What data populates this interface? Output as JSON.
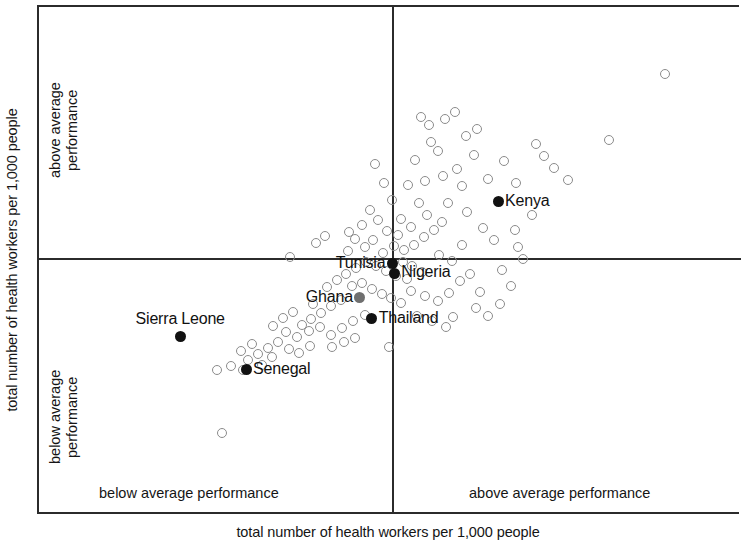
{
  "axes": {
    "y_title": "total number of health workers per 1,000 people",
    "x_title": "total number of health workers per 1,000 people"
  },
  "quadrants": {
    "y_above": "above average\nperformance",
    "y_above_line1": "above average",
    "y_above_line2": "performance",
    "y_below_line1": "below average",
    "y_below_line2": "performance",
    "x_below": "below average performance",
    "x_above": "above average performance"
  },
  "chart_data": {
    "type": "scatter",
    "title": "",
    "xlabel": "total number of health workers per 1,000 people",
    "ylabel": "total number of health workers per 1,000 people",
    "xlim": [
      0,
      100
    ],
    "ylim": [
      0,
      100
    ],
    "grid": false,
    "legend": "none",
    "quadrant_divider_x_pct": 50.5,
    "quadrant_divider_y_pct": 49.5,
    "highlighted": [
      {
        "name": "Kenya",
        "x_pct": 65.4,
        "y_pct": 38.4,
        "marker": "filled",
        "label_side": "right"
      },
      {
        "name": "Tunisia",
        "x_pct": 50.4,
        "y_pct": 50.6,
        "marker": "filled",
        "label_side": "left"
      },
      {
        "name": "Nigeria",
        "x_pct": 50.6,
        "y_pct": 52.5,
        "marker": "filled",
        "label_side": "right"
      },
      {
        "name": "Ghana",
        "x_pct": 45.7,
        "y_pct": 57.3,
        "marker": "grayfill",
        "label_side": "left"
      },
      {
        "name": "Thailand",
        "x_pct": 47.4,
        "y_pct": 61.5,
        "marker": "filled",
        "label_side": "right"
      },
      {
        "name": "Sierra Leone",
        "x_pct": 20.1,
        "y_pct": 64.9,
        "marker": "filled",
        "label_side": "above"
      },
      {
        "name": "Senegal",
        "x_pct": 29.5,
        "y_pct": 71.5,
        "marker": "filled",
        "label_side": "right"
      }
    ],
    "unlabeled_points": [
      [
        89.2,
        13.3
      ],
      [
        81.2,
        26.2
      ],
      [
        75.4,
        34.2
      ],
      [
        67.8,
        44.0
      ],
      [
        66.2,
        30.3
      ],
      [
        68.0,
        34.8
      ],
      [
        70.2,
        41.1
      ],
      [
        68.3,
        47.4
      ],
      [
        69.0,
        49.7
      ],
      [
        63.2,
        43.6
      ],
      [
        63.9,
        34.0
      ],
      [
        62.0,
        29.2
      ],
      [
        59.5,
        32.0
      ],
      [
        60.3,
        35.3
      ],
      [
        61.0,
        40.4
      ],
      [
        58.2,
        38.6
      ],
      [
        56.9,
        28.5
      ],
      [
        55.8,
        26.7
      ],
      [
        57.6,
        33.4
      ],
      [
        55.0,
        34.3
      ],
      [
        53.5,
        30.1
      ],
      [
        52.5,
        35.2
      ],
      [
        54.2,
        38.7
      ],
      [
        55.2,
        41.1
      ],
      [
        53.0,
        43.4
      ],
      [
        51.5,
        41.9
      ],
      [
        50.3,
        38.0
      ],
      [
        49.2,
        34.8
      ],
      [
        47.8,
        31.0
      ],
      [
        51.2,
        45.0
      ],
      [
        49.6,
        44.2
      ],
      [
        48.3,
        42.1
      ],
      [
        47.2,
        40.0
      ],
      [
        46.0,
        43.0
      ],
      [
        45.0,
        45.8
      ],
      [
        44.0,
        48.2
      ],
      [
        46.4,
        47.4
      ],
      [
        47.6,
        46.0
      ],
      [
        49.0,
        48.5
      ],
      [
        50.5,
        47.2
      ],
      [
        52.0,
        48.0
      ],
      [
        53.4,
        47.0
      ],
      [
        54.8,
        45.4
      ],
      [
        56.2,
        44.0
      ],
      [
        57.4,
        42.4
      ],
      [
        51.8,
        50.3
      ],
      [
        53.2,
        51.0
      ],
      [
        54.6,
        52.2
      ],
      [
        52.4,
        53.6
      ],
      [
        50.8,
        53.0
      ],
      [
        49.4,
        52.0
      ],
      [
        48.0,
        51.0
      ],
      [
        46.6,
        50.2
      ],
      [
        45.2,
        51.4
      ],
      [
        43.8,
        52.6
      ],
      [
        42.4,
        53.8
      ],
      [
        41.0,
        55.2
      ],
      [
        44.6,
        55.0
      ],
      [
        46.0,
        54.4
      ],
      [
        47.4,
        55.6
      ],
      [
        48.8,
        56.6
      ],
      [
        50.2,
        57.4
      ],
      [
        51.6,
        58.4
      ],
      [
        53.0,
        56.0
      ],
      [
        55.0,
        57.0
      ],
      [
        56.8,
        58.0
      ],
      [
        58.4,
        56.4
      ],
      [
        60.0,
        54.0
      ],
      [
        61.4,
        52.6
      ],
      [
        58.8,
        50.0
      ],
      [
        60.2,
        47.0
      ],
      [
        57.0,
        49.0
      ],
      [
        43.0,
        57.8
      ],
      [
        41.6,
        59.0
      ],
      [
        40.2,
        60.4
      ],
      [
        38.8,
        61.6
      ],
      [
        37.4,
        62.8
      ],
      [
        39.0,
        58.6
      ],
      [
        36.2,
        60.2
      ],
      [
        34.8,
        61.4
      ],
      [
        33.4,
        63.0
      ],
      [
        35.2,
        64.2
      ],
      [
        36.8,
        65.0
      ],
      [
        38.4,
        64.0
      ],
      [
        40.0,
        63.2
      ],
      [
        41.6,
        64.6
      ],
      [
        43.2,
        63.4
      ],
      [
        44.8,
        62.0
      ],
      [
        46.4,
        60.8
      ],
      [
        34.0,
        66.0
      ],
      [
        32.6,
        67.2
      ],
      [
        31.2,
        68.4
      ],
      [
        29.8,
        69.6
      ],
      [
        31.8,
        70.6
      ],
      [
        33.2,
        69.0
      ],
      [
        30.4,
        66.4
      ],
      [
        28.8,
        67.8
      ],
      [
        27.4,
        70.8
      ],
      [
        29.0,
        71.6
      ],
      [
        35.6,
        67.4
      ],
      [
        37.0,
        68.2
      ],
      [
        38.6,
        66.8
      ],
      [
        43.4,
        66.0
      ],
      [
        45.0,
        65.2
      ],
      [
        41.8,
        67.0
      ],
      [
        56.0,
        62.0
      ],
      [
        59.0,
        61.2
      ],
      [
        62.2,
        59.4
      ],
      [
        35.8,
        49.4
      ],
      [
        40.8,
        45.2
      ],
      [
        44.2,
        44.4
      ],
      [
        25.4,
        71.6
      ],
      [
        26.0,
        84.0
      ],
      [
        49.8,
        67.0
      ],
      [
        39.4,
        46.6
      ],
      [
        53.8,
        61.0
      ],
      [
        58.0,
        63.2
      ],
      [
        64.8,
        46.0
      ],
      [
        66.0,
        51.8
      ],
      [
        67.2,
        55.0
      ],
      [
        62.8,
        56.2
      ],
      [
        64.0,
        61.0
      ],
      [
        65.6,
        58.6
      ],
      [
        72.0,
        29.4
      ],
      [
        73.4,
        31.8
      ],
      [
        70.8,
        27.0
      ],
      [
        55.6,
        23.2
      ],
      [
        54.4,
        21.6
      ],
      [
        57.8,
        22.0
      ],
      [
        60.8,
        25.4
      ],
      [
        62.4,
        24.0
      ],
      [
        59.2,
        20.8
      ]
    ]
  }
}
